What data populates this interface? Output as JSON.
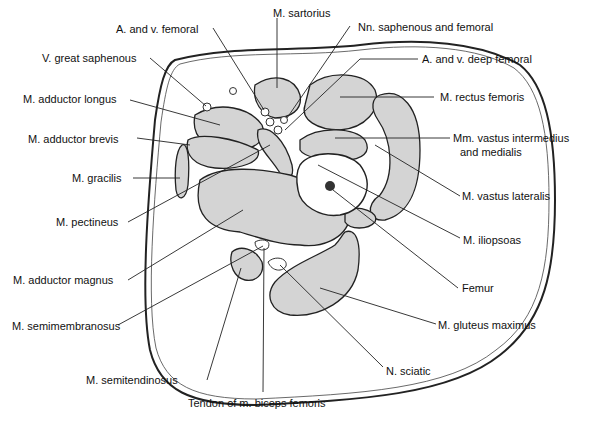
{
  "diagram": {
    "labels": {
      "sartorius": "M. sartorius",
      "femoral_av": "A. and v. femoral",
      "nn_saphenous_femoral": "Nn. saphenous and femoral",
      "great_saphenous": "V. great saphenous",
      "deep_femoral": "A. and v. deep femoral",
      "adductor_longus": "M. adductor longus",
      "rectus_femoris": "M. rectus femoris",
      "adductor_brevis": "M. adductor brevis",
      "vastus_intermedius_1": "Mm. vastus intermedius",
      "vastus_intermedius_2": "and medialis",
      "gracilis": "M. gracilis",
      "vastus_lateralis": "M. vastus lateralis",
      "pectineus": "M. pectineus",
      "iliopsoas": "M. iliopsoas",
      "adductor_magnus": "M. adductor magnus",
      "femur": "Femur",
      "semimembranosus": "M. semimembranosus",
      "gluteus_maximus": "M. gluteus maximus",
      "sciatic": "N. sciatic",
      "semitendinosus": "M. semitendinosus",
      "biceps_tendon": "Tendon of m. biceps femoris"
    }
  }
}
